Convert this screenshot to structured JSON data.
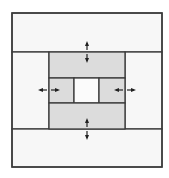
{
  "diagram": {
    "title": "",
    "colors": {
      "background": "#ffffff",
      "panel_light": "#f7f7f7",
      "panel_gray": "#dcdcdc",
      "center_cell": "#fbfbfb",
      "stroke": "#3a3a3a",
      "arrow": "#222222"
    },
    "outer_box": {
      "x": 12,
      "y": 13,
      "w": 150,
      "h": 154
    },
    "regions": [
      {
        "name": "top-band",
        "x": 12,
        "y": 13,
        "w": 150,
        "h": 39,
        "fill": "panel_light"
      },
      {
        "name": "left-band",
        "x": 12,
        "y": 52,
        "w": 37,
        "h": 77,
        "fill": "panel_light"
      },
      {
        "name": "right-band",
        "x": 125,
        "y": 52,
        "w": 37,
        "h": 77,
        "fill": "panel_light"
      },
      {
        "name": "bottom-band",
        "x": 12,
        "y": 129,
        "w": 150,
        "h": 38,
        "fill": "panel_light"
      },
      {
        "name": "inner-top",
        "x": 49,
        "y": 52,
        "w": 76,
        "h": 26,
        "fill": "panel_gray"
      },
      {
        "name": "inner-left",
        "x": 49,
        "y": 78,
        "w": 25,
        "h": 25,
        "fill": "panel_gray"
      },
      {
        "name": "inner-center",
        "x": 74,
        "y": 78,
        "w": 25,
        "h": 25,
        "fill": "center_cell"
      },
      {
        "name": "inner-right",
        "x": 99,
        "y": 78,
        "w": 26,
        "h": 25,
        "fill": "panel_gray"
      },
      {
        "name": "inner-bottom",
        "x": 49,
        "y": 103,
        "w": 76,
        "h": 26,
        "fill": "panel_gray"
      }
    ],
    "arrows": [
      {
        "name": "top-arrow",
        "orientation": "vertical",
        "cx": 87,
        "cy": 52
      },
      {
        "name": "bottom-arrow",
        "orientation": "vertical",
        "cx": 87,
        "cy": 129
      },
      {
        "name": "left-arrow",
        "orientation": "horizontal",
        "cx": 49,
        "cy": 90
      },
      {
        "name": "right-arrow",
        "orientation": "horizontal",
        "cx": 125,
        "cy": 90
      }
    ]
  }
}
